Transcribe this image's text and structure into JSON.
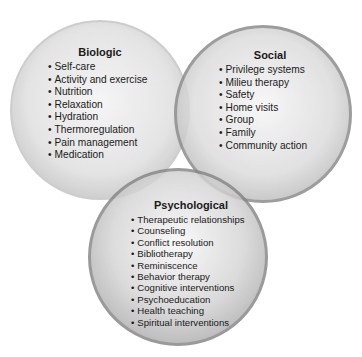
{
  "diagram": {
    "type": "venn",
    "circles": [
      {
        "id": "biologic",
        "title": "Biologic",
        "items": [
          "Self-care",
          "Activity and exercise",
          "Nutrition",
          "Relaxation",
          "Hydration",
          "Thermoregulation",
          "Pain management",
          "Medication"
        ]
      },
      {
        "id": "social",
        "title": "Social",
        "items": [
          "Privilege systems",
          "Milieu therapy",
          "Safety",
          "Home visits",
          "Group",
          "Family",
          "Community action"
        ]
      },
      {
        "id": "psychological",
        "title": "Psychological",
        "items": [
          "Therapeutic relationships",
          "Counseling",
          "Conflict resolution",
          "Bibliotherapy",
          "Reminiscence",
          "Behavior therapy",
          "Cognitive interventions",
          "Psychoeducation",
          "Health teaching",
          "Spiritual interventions"
        ]
      }
    ]
  }
}
